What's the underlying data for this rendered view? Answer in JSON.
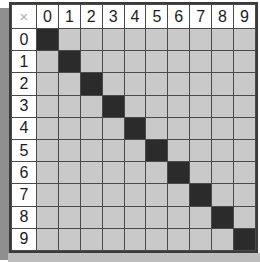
{
  "table": {
    "corner_label": "×",
    "corner_icon_name": "multiply-icon",
    "column_headers": [
      "0",
      "1",
      "2",
      "3",
      "4",
      "5",
      "6",
      "7",
      "8",
      "9"
    ],
    "row_headers": [
      "0",
      "1",
      "2",
      "3",
      "4",
      "5",
      "6",
      "7",
      "8",
      "9"
    ],
    "cell_colors": {
      "empty": "#c9c9c9",
      "filled": "#2b2b2b",
      "header_background": "#ffffff",
      "grid_line": "#4a4a4a",
      "border": "#3a3a3a",
      "corner_symbol": "#b0b0b0",
      "shadow_left": "#8f8f8f",
      "shadow_bottom": "#bdbdbd"
    },
    "rows": [
      {
        "header": "0",
        "cells": [
          1,
          0,
          0,
          0,
          0,
          0,
          0,
          0,
          0,
          0
        ]
      },
      {
        "header": "1",
        "cells": [
          0,
          1,
          0,
          0,
          0,
          0,
          0,
          0,
          0,
          0
        ]
      },
      {
        "header": "2",
        "cells": [
          0,
          0,
          1,
          0,
          0,
          0,
          0,
          0,
          0,
          0
        ]
      },
      {
        "header": "3",
        "cells": [
          0,
          0,
          0,
          1,
          0,
          0,
          0,
          0,
          0,
          0
        ]
      },
      {
        "header": "4",
        "cells": [
          0,
          0,
          0,
          0,
          1,
          0,
          0,
          0,
          0,
          0
        ]
      },
      {
        "header": "5",
        "cells": [
          0,
          0,
          0,
          0,
          0,
          1,
          0,
          0,
          0,
          0
        ]
      },
      {
        "header": "6",
        "cells": [
          0,
          0,
          0,
          0,
          0,
          0,
          1,
          0,
          0,
          0
        ]
      },
      {
        "header": "7",
        "cells": [
          0,
          0,
          0,
          0,
          0,
          0,
          0,
          1,
          0,
          0
        ]
      },
      {
        "header": "8",
        "cells": [
          0,
          0,
          0,
          0,
          0,
          0,
          0,
          0,
          1,
          0
        ]
      },
      {
        "header": "9",
        "cells": [
          0,
          0,
          0,
          0,
          0,
          0,
          0,
          0,
          0,
          1
        ]
      }
    ]
  }
}
